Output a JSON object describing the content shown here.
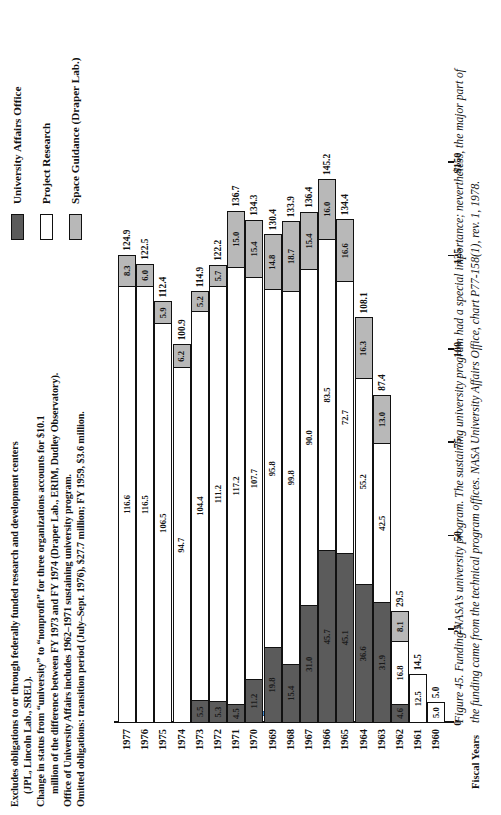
{
  "notes": {
    "lines": [
      {
        "text": "Excludes obligations to or through federally funded research and development centers",
        "indent": false
      },
      {
        "text": "(JPL, Lincoln Lab., SREL).",
        "indent": true
      },
      {
        "text": "Change in status from “university” to “nonprofit” for three organizations accounts for $10.1",
        "indent": false
      },
      {
        "text": "million of the difference between FY 1973 and FY 1974 (Draper Lab., ERIM, Dudley Observatory).",
        "indent": true
      },
      {
        "text": "Office of University Affairs includes 1962–1971 sustaining university program.",
        "indent": false
      },
      {
        "text": "Omitted obligations: transition period (July–Sept. 1976), $27.7 million; FY 1959, $3.6 million.",
        "indent": false
      }
    ]
  },
  "legend": {
    "items": [
      {
        "label": "University Affairs Office",
        "swatch": "dark",
        "color": "#5b5b5b"
      },
      {
        "label": "Project Research",
        "swatch": "white",
        "color": "#ffffff"
      },
      {
        "label": "Space Guidance (Draper Lab.)",
        "swatch": "light",
        "color": "#b8b8b8"
      }
    ]
  },
  "caption": {
    "text": "Figure 45. Funding NASA’s university program. The sustaining university program had a special importance; nevertheless, the major part of the funding came from the technical program offices. NASA University Affairs Office, chart P77-158(1), rev. 1, 1978."
  },
  "chart_data": {
    "type": "bar",
    "orientation": "vertical",
    "stacked": true,
    "title": "Funding NASA’s university program",
    "xlabel": "Fiscal Years",
    "ylabel": "Amount (millions)",
    "ylim": [
      0,
      150
    ],
    "yticks": [
      0,
      25,
      50,
      75,
      100,
      125,
      150
    ],
    "ytick_labels": [
      "0",
      "25",
      "50",
      "75",
      "100",
      "125",
      "$150"
    ],
    "grid": false,
    "legend_position": "top-right",
    "categories": [
      "1960",
      "1961",
      "1962",
      "1963",
      "1964",
      "1965",
      "1966",
      "1967",
      "1968",
      "1969",
      "1970",
      "1971",
      "1972",
      "1973",
      "1974",
      "1975",
      "1976",
      "1977"
    ],
    "series": [
      {
        "name": "University Affairs Office",
        "color": "#5b5b5b",
        "values": [
          null,
          null,
          4.6,
          31.9,
          36.6,
          45.1,
          45.7,
          31.0,
          15.4,
          19.8,
          11.2,
          4.5,
          5.3,
          5.5,
          null,
          null,
          null,
          null
        ]
      },
      {
        "name": "Project Research",
        "color": "#ffffff",
        "values": [
          5.0,
          12.5,
          16.8,
          42.5,
          55.2,
          72.7,
          83.5,
          90.0,
          99.8,
          95.8,
          107.7,
          117.2,
          111.2,
          104.4,
          94.7,
          106.5,
          116.5,
          116.6
        ]
      },
      {
        "name": "Space Guidance (Draper Lab.)",
        "color": "#b8b8b8",
        "values": [
          null,
          null,
          8.1,
          13.0,
          16.3,
          16.6,
          16.0,
          15.4,
          18.7,
          14.8,
          15.4,
          15.0,
          5.7,
          5.2,
          6.2,
          5.9,
          6.0,
          8.3
        ]
      }
    ],
    "totals": [
      5.0,
      14.5,
      29.5,
      87.4,
      108.1,
      134.4,
      145.2,
      136.4,
      133.9,
      130.4,
      134.3,
      136.7,
      122.2,
      114.9,
      100.9,
      112.4,
      122.5,
      124.9
    ]
  }
}
